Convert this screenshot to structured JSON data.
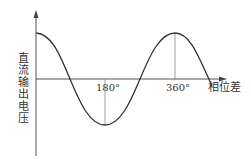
{
  "diagram": {
    "title": "",
    "y_axis_label": "直流输出电压",
    "x_axis_label": "相位差",
    "ticks": [
      {
        "label": "180°",
        "value": 180
      },
      {
        "label": "360°",
        "value": 360
      }
    ],
    "curve": "cosine-like: maximum at 0°, minimum at 180°, maximum at 360°",
    "colors": {
      "line": "#333333",
      "axis": "#555555",
      "guide": "#888888",
      "background": "#ffffff"
    }
  }
}
